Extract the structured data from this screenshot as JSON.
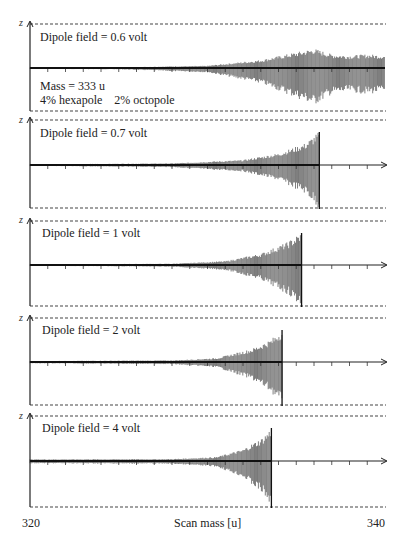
{
  "figure": {
    "x_axis_label": "Scan mass [u]",
    "x_min_label": "320",
    "x_max_label": "340",
    "y_axis_symbol": "z",
    "panel1_notes": [
      "Mass = 333 u",
      "4% hexapole    2% octopole"
    ]
  },
  "panels": [
    {
      "label": "Dipole field = 0.6 volt"
    },
    {
      "label": "Dipole field = 0.7 volt"
    },
    {
      "label": "Dipole field = 1 volt"
    },
    {
      "label": "Dipole field = 2 volt"
    },
    {
      "label": "Dipole field = 4 volt"
    }
  ],
  "chart_data": {
    "type": "line",
    "title": "",
    "xlabel": "Scan mass [u]",
    "ylabel": "z",
    "xlim": [
      320,
      340
    ],
    "x_ticks_every": 1,
    "grid": false,
    "annotations": [
      "Mass = 333 u",
      "4% hexapole",
      "2% octopole"
    ],
    "layout": "5 vertically stacked panels sharing x axis; dashed lines mark electrode boundaries (z limits)",
    "series": [
      {
        "name": "Dipole field = 0.6 volt",
        "dipole_field_volt": 0.6,
        "ejection_mass_u": null,
        "description": "ion not ejected; oscillation grows from ~330 u and beats with large amplitude up to 340 u",
        "envelope_points": [
          [
            320,
            0.02
          ],
          [
            325,
            0.03
          ],
          [
            330,
            0.1
          ],
          [
            333,
            0.35
          ],
          [
            336,
            0.85
          ],
          [
            337,
            0.6
          ],
          [
            338,
            0.55
          ],
          [
            339,
            0.6
          ],
          [
            340,
            0.55
          ]
        ]
      },
      {
        "name": "Dipole field = 0.7 volt",
        "dipole_field_volt": 0.7,
        "ejection_mass_u": 336.3,
        "envelope_points": [
          [
            320,
            0.02
          ],
          [
            328,
            0.05
          ],
          [
            332,
            0.15
          ],
          [
            334,
            0.35
          ],
          [
            335.5,
            0.65
          ],
          [
            336.3,
            1.0
          ]
        ]
      },
      {
        "name": "Dipole field = 1 volt",
        "dipole_field_volt": 1,
        "ejection_mass_u": 335.3,
        "envelope_points": [
          [
            320,
            0.02
          ],
          [
            328,
            0.04
          ],
          [
            331,
            0.12
          ],
          [
            333,
            0.35
          ],
          [
            334.5,
            0.7
          ],
          [
            335.3,
            1.0
          ]
        ]
      },
      {
        "name": "Dipole field = 2 volt",
        "dipole_field_volt": 2,
        "ejection_mass_u": 334.2,
        "envelope_points": [
          [
            320,
            0.03
          ],
          [
            328,
            0.05
          ],
          [
            330.5,
            0.12
          ],
          [
            332.5,
            0.4
          ],
          [
            333.6,
            0.7
          ],
          [
            334.2,
            1.0
          ]
        ]
      },
      {
        "name": "Dipole field = 4 volt",
        "dipole_field_volt": 4,
        "ejection_mass_u": 333.6,
        "envelope_points": [
          [
            320,
            0.05
          ],
          [
            328,
            0.06
          ],
          [
            330.5,
            0.12
          ],
          [
            332,
            0.35
          ],
          [
            333.1,
            0.7
          ],
          [
            333.6,
            1.0
          ]
        ]
      }
    ]
  }
}
